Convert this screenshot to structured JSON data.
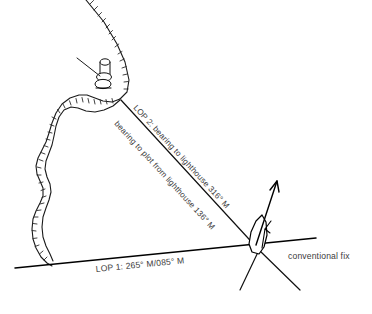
{
  "diagram": {
    "canvas": {
      "width": 372,
      "height": 314,
      "background": "#ffffff"
    },
    "colors": {
      "line": "#000000",
      "coastline": "#1a1a1a",
      "hatch": "#2b2b2b",
      "text": "#3b3b3b",
      "background": "#ffffff"
    },
    "labels": {
      "lop1": "LOP 1: 265° M/085° M",
      "lop2": "LOP 2: bearing to lighthouse 316° M",
      "bearing_reciprocal": "bearing to plot from lighthouse 136° M",
      "fix": "conventional fix"
    },
    "features": {
      "lighthouse": "lighthouse-symbol",
      "vessel": "vessel-symbol",
      "course_arrow": "course-arrow",
      "coastline": "coastline-with-land-hatching",
      "leader": "lighthouse-leader-line"
    },
    "bearings": {
      "lop1_value": "265° M",
      "lop1_reciprocal": "085° M",
      "lop2_value": "316° M",
      "lop2_reciprocal": "136° M"
    }
  }
}
